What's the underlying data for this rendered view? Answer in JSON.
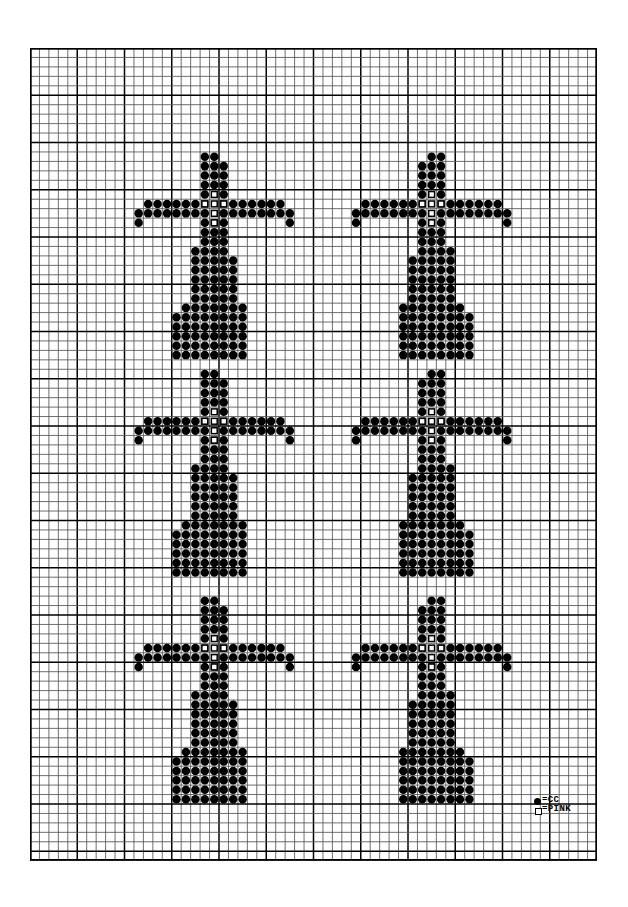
{
  "document": {
    "title": "Cross Bead Pattern Chart",
    "kind": "bead-loom-pattern"
  },
  "canvas": {
    "width": 628,
    "height": 907,
    "background": "#ffffff"
  },
  "grid": {
    "origin_x": 30,
    "origin_y": 48,
    "cell_size": 9.45,
    "columns": 60,
    "rows": 86,
    "minor_line_color": "#555555",
    "major_line_color": "#000000",
    "major_every": 5,
    "border_color": "#000000"
  },
  "legend": {
    "position": "bottom-right",
    "items": [
      {
        "symbol": "filled-circle",
        "symbol_char": "●",
        "separator": "=",
        "label": "CC",
        "color": "#000000"
      },
      {
        "symbol": "open-square",
        "symbol_char": "□",
        "separator": "=",
        "label": "PINK",
        "color": "#ffffff"
      }
    ]
  },
  "chart_data": {
    "type": "heatmap",
    "subtitle": "",
    "xlabel": "",
    "ylabel": "",
    "grid": true,
    "legend_position": "bottom-right",
    "columns": 60,
    "rows": 86,
    "cell_size": 9.45,
    "symbol_colors": {
      "CC": "#000000",
      "PINK": "#ffffff"
    },
    "motif": {
      "name": "cross",
      "width": 17,
      "height": 24,
      "cells": [
        {
          "y": 0,
          "x": [
            7,
            8
          ]
        },
        {
          "y": 1,
          "x": [
            7,
            8,
            9
          ]
        },
        {
          "y": 2,
          "x": [
            7,
            8,
            9
          ]
        },
        {
          "y": 3,
          "x": [
            7,
            8,
            9
          ]
        },
        {
          "y": 4,
          "x": [
            7,
            9
          ]
        },
        {
          "y": 5,
          "x": [
            1,
            2,
            3,
            4,
            5,
            6,
            7,
            9,
            10,
            11,
            12,
            13,
            14,
            15
          ]
        },
        {
          "y": 6,
          "x": [
            0,
            1,
            2,
            3,
            4,
            5,
            6,
            7,
            9,
            10,
            11,
            12,
            13,
            14,
            15,
            16
          ]
        },
        {
          "y": 7,
          "x": [
            0,
            7,
            8,
            9,
            16
          ]
        },
        {
          "y": 8,
          "x": [
            7,
            8,
            9
          ]
        },
        {
          "y": 9,
          "x": [
            7,
            8,
            9
          ]
        },
        {
          "y": 10,
          "x": [
            6,
            7,
            8,
            9
          ]
        },
        {
          "y": 11,
          "x": [
            6,
            7,
            8,
            9,
            10
          ]
        },
        {
          "y": 12,
          "x": [
            6,
            7,
            8,
            9,
            10
          ]
        },
        {
          "y": 13,
          "x": [
            6,
            7,
            8,
            9,
            10
          ]
        },
        {
          "y": 14,
          "x": [
            6,
            7,
            8,
            9,
            10
          ]
        },
        {
          "y": 15,
          "x": [
            6,
            7,
            8,
            9,
            10
          ]
        },
        {
          "y": 16,
          "x": [
            5,
            6,
            7,
            8,
            9,
            10,
            11
          ]
        },
        {
          "y": 17,
          "x": [
            4,
            5,
            6,
            7,
            8,
            9,
            10,
            11
          ]
        },
        {
          "y": 18,
          "x": [
            4,
            5,
            6,
            7,
            8,
            9,
            10,
            11
          ]
        },
        {
          "y": 19,
          "x": [
            4,
            5,
            6,
            7,
            8,
            9,
            10,
            11
          ]
        },
        {
          "y": 20,
          "x": [
            4,
            5,
            6,
            7,
            8,
            9,
            10,
            11
          ]
        },
        {
          "y": 21,
          "x": [
            4,
            5,
            6,
            7,
            8,
            9,
            10,
            11
          ]
        }
      ],
      "pink_cells": [
        {
          "y": 4,
          "x": 8
        },
        {
          "y": 5,
          "x": 8
        },
        {
          "y": 6,
          "x": 8
        },
        {
          "y": 7,
          "x": 8
        },
        {
          "y": 5,
          "x": 7
        },
        {
          "y": 5,
          "x": 9
        }
      ]
    },
    "motif_placements": [
      {
        "id": "cross-top-left",
        "col": 11,
        "row": 11,
        "mirrored": false
      },
      {
        "id": "cross-top-right",
        "col": 34,
        "row": 11,
        "mirrored": true
      },
      {
        "id": "cross-middle-left",
        "col": 11,
        "row": 34,
        "mirrored": false
      },
      {
        "id": "cross-middle-right",
        "col": 34,
        "row": 34,
        "mirrored": true
      },
      {
        "id": "cross-bottom-left",
        "col": 11,
        "row": 58,
        "mirrored": false
      },
      {
        "id": "cross-bottom-right",
        "col": 34,
        "row": 58,
        "mirrored": true
      }
    ],
    "counts": {
      "motifs": 6,
      "symbols": [
        "CC",
        "PINK"
      ]
    }
  }
}
